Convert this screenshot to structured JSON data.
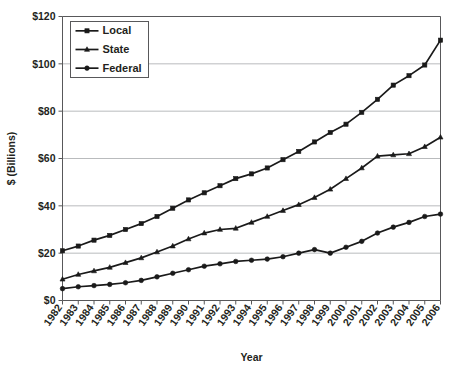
{
  "chart_data": {
    "type": "line",
    "title": "",
    "xlabel": "Year",
    "ylabel": "$ (Billions)",
    "xlim": [
      1982,
      2006
    ],
    "ylim": [
      0,
      120
    ],
    "ytick_labels": [
      "$0",
      "$20",
      "$40",
      "$60",
      "$80",
      "$100",
      "$120"
    ],
    "ytick_values": [
      0,
      20,
      40,
      60,
      80,
      100,
      120
    ],
    "grid": "horizontal",
    "legend_position": "top-left-inside",
    "x": [
      1982,
      1983,
      1984,
      1985,
      1986,
      1987,
      1988,
      1989,
      1990,
      1991,
      1992,
      1993,
      1994,
      1995,
      1996,
      1997,
      1998,
      1999,
      2000,
      2001,
      2002,
      2003,
      2004,
      2005,
      2006
    ],
    "categories": [
      "1982",
      "1983",
      "1984",
      "1985",
      "1986",
      "1987",
      "1988",
      "1989",
      "1990",
      "1991",
      "1992",
      "1993",
      "1994",
      "1995",
      "1996",
      "1997",
      "1998",
      "1999",
      "2000",
      "2001",
      "2002",
      "2003",
      "2004",
      "2005",
      "2006"
    ],
    "series": [
      {
        "name": "Local",
        "marker": "square",
        "color": "#1a1a1a",
        "values": [
          21,
          23,
          25.5,
          27.5,
          30,
          32.5,
          35.5,
          39,
          42.5,
          45.5,
          48.5,
          51.5,
          53.5,
          56,
          59.5,
          63,
          67,
          71,
          74.5,
          79.5,
          85,
          91,
          95,
          99.5,
          110
        ]
      },
      {
        "name": "State",
        "marker": "triangle",
        "color": "#1a1a1a",
        "values": [
          9,
          11,
          12.5,
          14,
          16,
          18,
          20.5,
          23,
          26,
          28.5,
          30,
          30.5,
          33,
          35.5,
          38,
          40.5,
          43.5,
          47,
          51.5,
          56,
          61,
          61.5,
          62,
          65,
          69
        ]
      },
      {
        "name": "Federal",
        "marker": "circle",
        "color": "#1a1a1a",
        "values": [
          5,
          5.8,
          6.3,
          6.8,
          7.5,
          8.5,
          10,
          11.5,
          13,
          14.5,
          15.5,
          16.5,
          17,
          17.5,
          18.5,
          20,
          21.5,
          20,
          22.5,
          25,
          28.5,
          31,
          33,
          35.5,
          36.5
        ]
      }
    ]
  },
  "legend": {
    "items": [
      {
        "label": "Local"
      },
      {
        "label": "State"
      },
      {
        "label": "Federal"
      }
    ]
  },
  "caption": {
    "text": ""
  }
}
